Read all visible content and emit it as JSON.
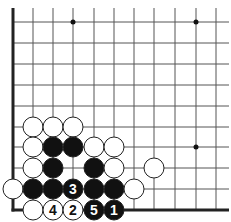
{
  "diagram": {
    "type": "go-board-corner",
    "colors": {
      "line": "#555555",
      "edge": "#222222",
      "black_stone": "#111111",
      "white_stone": "#ffffff",
      "stone_outline": "#222222",
      "hoshi": "#111111"
    },
    "grid": {
      "columns_x": [
        13,
        33,
        53,
        73,
        94,
        114,
        134,
        154,
        175,
        196,
        216
      ],
      "rows_y": [
        22,
        43,
        64,
        85,
        106,
        127,
        147,
        168,
        189,
        210
      ],
      "top_y": 8,
      "right_x": 229,
      "left_edge_x": 13,
      "bottom_edge_y": 210
    },
    "hoshi": [
      {
        "x": 73,
        "y": 22
      },
      {
        "x": 196,
        "y": 22
      },
      {
        "x": 196,
        "y": 147
      }
    ],
    "stones": [
      {
        "color": "white",
        "x": 33,
        "y": 127,
        "label": ""
      },
      {
        "color": "white",
        "x": 53,
        "y": 127,
        "label": ""
      },
      {
        "color": "white",
        "x": 73,
        "y": 127,
        "label": ""
      },
      {
        "color": "white",
        "x": 33,
        "y": 147,
        "label": ""
      },
      {
        "color": "black",
        "x": 53,
        "y": 147,
        "label": ""
      },
      {
        "color": "black",
        "x": 73,
        "y": 147,
        "label": ""
      },
      {
        "color": "white",
        "x": 94,
        "y": 147,
        "label": ""
      },
      {
        "color": "white",
        "x": 114,
        "y": 147,
        "label": ""
      },
      {
        "color": "white",
        "x": 33,
        "y": 168,
        "label": ""
      },
      {
        "color": "black",
        "x": 53,
        "y": 168,
        "label": ""
      },
      {
        "color": "black",
        "x": 94,
        "y": 168,
        "label": ""
      },
      {
        "color": "white",
        "x": 114,
        "y": 168,
        "label": ""
      },
      {
        "color": "white",
        "x": 154,
        "y": 168,
        "label": ""
      },
      {
        "color": "white",
        "x": 13,
        "y": 189,
        "label": ""
      },
      {
        "color": "black",
        "x": 33,
        "y": 189,
        "label": ""
      },
      {
        "color": "black",
        "x": 53,
        "y": 189,
        "label": ""
      },
      {
        "color": "black",
        "x": 73,
        "y": 189,
        "label": "3"
      },
      {
        "color": "black",
        "x": 94,
        "y": 189,
        "label": ""
      },
      {
        "color": "black",
        "x": 114,
        "y": 189,
        "label": ""
      },
      {
        "color": "white",
        "x": 134,
        "y": 189,
        "label": ""
      },
      {
        "color": "white",
        "x": 33,
        "y": 210,
        "label": ""
      },
      {
        "color": "white",
        "x": 53,
        "y": 210,
        "label": "4"
      },
      {
        "color": "white",
        "x": 73,
        "y": 210,
        "label": "2"
      },
      {
        "color": "black",
        "x": 94,
        "y": 210,
        "label": "5"
      },
      {
        "color": "black",
        "x": 114,
        "y": 210,
        "label": "1"
      }
    ],
    "stone_radius": 10
  }
}
